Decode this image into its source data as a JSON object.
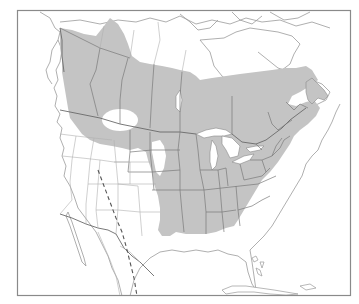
{
  "map": {
    "type": "species-range-map",
    "region": "North America",
    "colors": {
      "background": "#ffffff",
      "range_fill": "#c4c4c4",
      "frame": "#8a8a8a",
      "borders": "#6a6a6a",
      "coastline": "#9a9a9a",
      "dashed_line": "#555555"
    },
    "layers": [
      {
        "name": "frame",
        "label": ""
      },
      {
        "name": "range-shaded-area",
        "label": ""
      },
      {
        "name": "coastlines",
        "label": ""
      },
      {
        "name": "political-borders",
        "label": ""
      },
      {
        "name": "great-lakes",
        "label": ""
      },
      {
        "name": "dashed-boundary-line",
        "label": ""
      }
    ],
    "range_gaps": [
      {
        "name": "gap-southern-alberta-saskatchewan"
      },
      {
        "name": "gap-south-dakota"
      },
      {
        "name": "gap-colorado-edge"
      }
    ]
  }
}
